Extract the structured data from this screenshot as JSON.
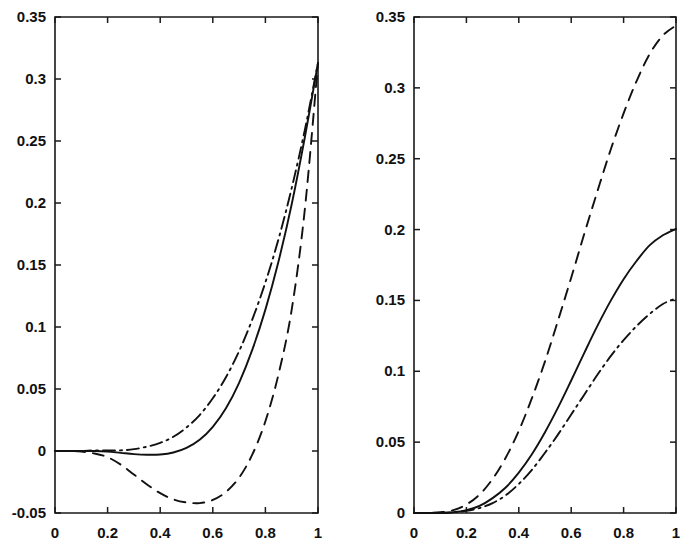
{
  "figure": {
    "background": "#ffffff",
    "foreground": "#111111",
    "width": 693,
    "height": 555,
    "panel_count": 2
  },
  "chart_data": [
    {
      "type": "line",
      "panel": "left",
      "title": "",
      "subtitle": "",
      "xlabel": "",
      "ylabel": "",
      "xlim": [
        0,
        1
      ],
      "ylim": [
        -0.05,
        0.35
      ],
      "grid": false,
      "legend": "none",
      "box": true,
      "xticks": [
        0,
        0.2,
        0.4,
        0.6,
        0.8,
        1
      ],
      "xticklabels": [
        "0",
        "0.2",
        "0.4",
        "0.6",
        "0.8",
        "1"
      ],
      "yticks": [
        -0.05,
        0,
        0.05,
        0.1,
        0.15,
        0.2,
        0.25,
        0.3,
        0.35
      ],
      "yticklabels": [
        "-0.05",
        "0",
        "0.05",
        "0.1",
        "0.15",
        "0.2",
        "0.25",
        "0.3",
        "0.35"
      ],
      "x": [
        0,
        0.05,
        0.1,
        0.15,
        0.2,
        0.25,
        0.3,
        0.35,
        0.4,
        0.45,
        0.5,
        0.55,
        0.6,
        0.65,
        0.7,
        0.75,
        0.8,
        0.85,
        0.9,
        0.95,
        1
      ],
      "series": [
        {
          "name": "solid",
          "style": "solid",
          "values": [
            0,
            0,
            0,
            0,
            -0.0005,
            -0.0015,
            -0.0025,
            -0.003,
            -0.0028,
            -0.0012,
            0.0025,
            0.009,
            0.0195,
            0.0345,
            0.055,
            0.0815,
            0.114,
            0.153,
            0.199,
            0.253,
            0.313
          ]
        },
        {
          "name": "dashed",
          "style": "dashed",
          "values": [
            0,
            0,
            -0.0005,
            -0.002,
            -0.005,
            -0.011,
            -0.019,
            -0.027,
            -0.034,
            -0.039,
            -0.0415,
            -0.042,
            -0.0395,
            -0.033,
            -0.0215,
            -0.003,
            0.024,
            0.062,
            0.114,
            0.195,
            0.313
          ]
        },
        {
          "name": "dashdot",
          "style": "dashdot",
          "values": [
            0,
            0,
            0,
            0.0005,
            0.0005,
            0.0005,
            0.0015,
            0.0035,
            0.0065,
            0.0115,
            0.019,
            0.029,
            0.0425,
            0.0595,
            0.0805,
            0.106,
            0.136,
            0.171,
            0.212,
            0.259,
            0.313
          ]
        }
      ]
    },
    {
      "type": "line",
      "panel": "right",
      "title": "",
      "subtitle": "",
      "xlabel": "",
      "ylabel": "",
      "xlim": [
        0,
        1
      ],
      "ylim": [
        0,
        0.35
      ],
      "grid": false,
      "legend": "none",
      "box": true,
      "xticks": [
        0,
        0.2,
        0.4,
        0.6,
        0.8,
        1
      ],
      "xticklabels": [
        "0",
        "0.2",
        "0.4",
        "0.6",
        "0.8",
        "1"
      ],
      "yticks": [
        0,
        0.05,
        0.1,
        0.15,
        0.2,
        0.25,
        0.3,
        0.35
      ],
      "yticklabels": [
        "0",
        "0.05",
        "0.1",
        "0.15",
        "0.2",
        "0.25",
        "0.3",
        "0.35"
      ],
      "x": [
        0,
        0.05,
        0.1,
        0.15,
        0.2,
        0.25,
        0.3,
        0.35,
        0.4,
        0.45,
        0.5,
        0.55,
        0.6,
        0.65,
        0.7,
        0.75,
        0.8,
        0.85,
        0.9,
        0.95,
        1
      ],
      "series": [
        {
          "name": "solid",
          "style": "solid",
          "values": [
            0,
            0,
            0,
            0.0005,
            0.002,
            0.005,
            0.0105,
            0.018,
            0.0285,
            0.0415,
            0.057,
            0.0745,
            0.0935,
            0.113,
            0.132,
            0.1495,
            0.165,
            0.178,
            0.189,
            0.196,
            0.2005
          ]
        },
        {
          "name": "dashed",
          "style": "dashed",
          "values": [
            0,
            0,
            0.0005,
            0.002,
            0.006,
            0.013,
            0.024,
            0.039,
            0.058,
            0.081,
            0.107,
            0.136,
            0.166,
            0.197,
            0.227,
            0.256,
            0.282,
            0.305,
            0.324,
            0.337,
            0.344
          ]
        },
        {
          "name": "dashdot",
          "style": "dashdot",
          "values": [
            0,
            0,
            0,
            0.0005,
            0.0015,
            0.0035,
            0.007,
            0.0125,
            0.0205,
            0.0305,
            0.0425,
            0.0555,
            0.0695,
            0.0835,
            0.0975,
            0.1105,
            0.122,
            0.132,
            0.1405,
            0.1475,
            0.1515
          ]
        }
      ]
    }
  ]
}
